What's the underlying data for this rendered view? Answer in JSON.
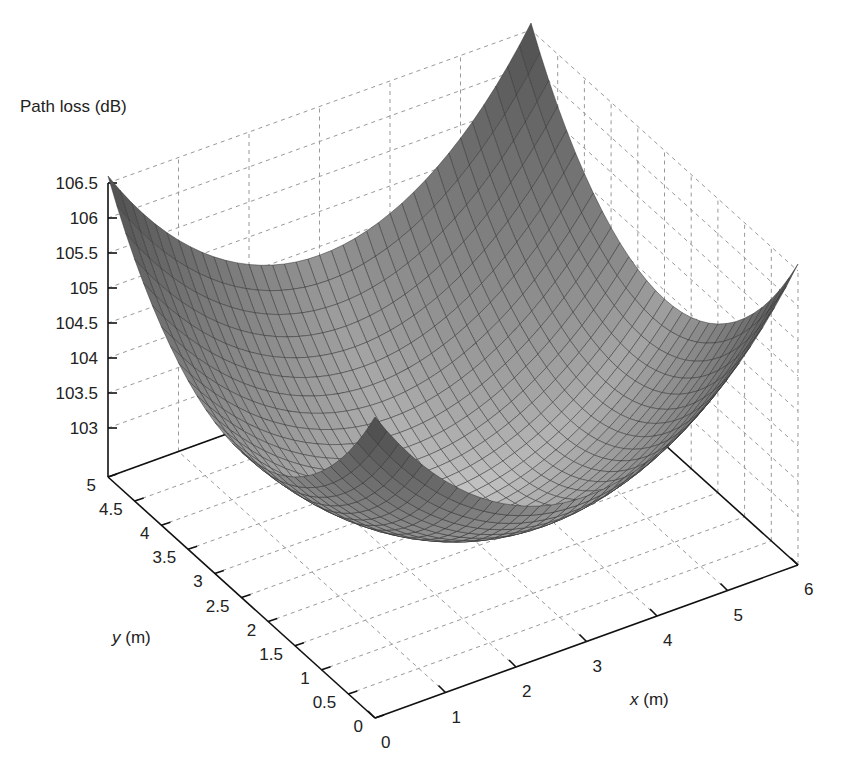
{
  "chart_data": {
    "type": "surface3d",
    "title": "",
    "zlabel": "Path loss (dB)",
    "xlabel": "x (m)",
    "ylabel": "y (m)",
    "xlim": [
      0,
      6
    ],
    "ylim": [
      0,
      5
    ],
    "zlim": [
      102.3,
      106.5
    ],
    "x_ticks": [
      "0",
      "1",
      "2",
      "3",
      "4",
      "5",
      "6"
    ],
    "y_ticks": [
      "0",
      "0.5",
      "1",
      "1.5",
      "2",
      "2.5",
      "3",
      "3.5",
      "4",
      "4.5",
      "5"
    ],
    "z_ticks": [
      "103",
      "103.5",
      "104",
      "104.5",
      "105",
      "105.5",
      "106",
      "106.5"
    ],
    "surface": {
      "description": "Bowl-shaped path loss surface, minimum near room centre, maximum at the four corners",
      "min_value": 102.6,
      "min_location": [
        3,
        2.5
      ],
      "corner_value": 106.3,
      "edge_midpoint_value": 104.3,
      "grid_nx": 36,
      "grid_ny": 30
    },
    "grid": true,
    "colormap": "grayscale"
  },
  "labels": {
    "zlabel": "Path loss (dB)",
    "xlabel_var": "x",
    "xlabel_unit": " (m)",
    "ylabel_var": "y",
    "ylabel_unit": " (m)"
  }
}
